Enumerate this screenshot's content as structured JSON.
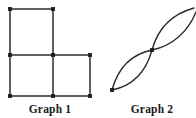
{
  "figure": {
    "width": 196,
    "height": 118,
    "background_color": "#ffffff",
    "ink_color": "#2b2b2b",
    "vertex_color": "#1a1a1a"
  },
  "panels": [
    {
      "id": "graph-1",
      "caption": "Graph 1",
      "caption_position": {
        "x": 50,
        "y": 113
      },
      "shape_description": "three unit squares in an L / tetromino arrangement",
      "vertices": [
        {
          "name": "v-top-left",
          "x": 10,
          "y": 9
        },
        {
          "name": "v-top-right",
          "x": 53,
          "y": 9
        },
        {
          "name": "v-mid-left",
          "x": 10,
          "y": 55
        },
        {
          "name": "v-mid-center",
          "x": 53,
          "y": 55
        },
        {
          "name": "v-mid-right",
          "x": 90,
          "y": 55
        },
        {
          "name": "v-bottom-left",
          "x": 10,
          "y": 96
        },
        {
          "name": "v-bottom-center",
          "x": 53,
          "y": 96
        },
        {
          "name": "v-bottom-right",
          "x": 90,
          "y": 96
        }
      ],
      "edges": [
        {
          "name": "edge-top",
          "x1": 10,
          "y1": 9,
          "x2": 53,
          "y2": 9
        },
        {
          "name": "edge-upper-left",
          "x1": 10,
          "y1": 9,
          "x2": 10,
          "y2": 55
        },
        {
          "name": "edge-upper-right",
          "x1": 53,
          "y1": 9,
          "x2": 53,
          "y2": 55
        },
        {
          "name": "edge-middle-horiz",
          "x1": 10,
          "y1": 55,
          "x2": 90,
          "y2": 55
        },
        {
          "name": "edge-lower-left",
          "x1": 10,
          "y1": 55,
          "x2": 10,
          "y2": 96
        },
        {
          "name": "edge-lower-center",
          "x1": 53,
          "y1": 55,
          "x2": 53,
          "y2": 96
        },
        {
          "name": "edge-lower-right",
          "x1": 90,
          "y1": 55,
          "x2": 90,
          "y2": 96
        },
        {
          "name": "edge-bottom-horiz",
          "x1": 10,
          "y1": 96,
          "x2": 90,
          "y2": 96
        }
      ]
    },
    {
      "id": "graph-2",
      "caption": "Graph 2",
      "caption_position": {
        "x": 152,
        "y": 113
      },
      "shape_description": "figure-eight of two lens shapes; upper lens clipped at right edge",
      "vertices": [
        {
          "name": "v-bottom-left",
          "x": 112,
          "y": 90
        },
        {
          "name": "v-center",
          "x": 152,
          "y": 50
        }
      ],
      "curves": [
        {
          "name": "lower-lens-upper-arc",
          "path": "M 112 90 C 118 68 132 54 152 50"
        },
        {
          "name": "lower-lens-lower-arc",
          "path": "M 112 90 C 132 86 146 72 152 50"
        },
        {
          "name": "upper-lens-upper-arc",
          "path": "M 152 50 C 158 28 172 14 194 8"
        },
        {
          "name": "upper-lens-lower-arc",
          "path": "M 152 50 C 172 46 188 32 196 12"
        }
      ]
    }
  ]
}
